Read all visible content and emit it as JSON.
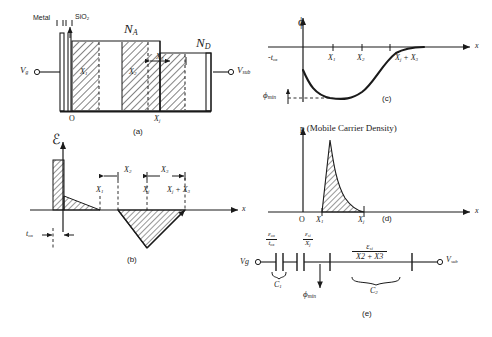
{
  "figure": {
    "ink_color": "#1a1a1a",
    "background": "#ffffff"
  },
  "panel_a": {
    "id": "(a)",
    "labels": {
      "metal": "Metal",
      "oxide": "SiO2",
      "oxide_sub": "2",
      "acceptor": "N",
      "acceptor_sub": "A",
      "donor": "N",
      "donor_sub": "D",
      "gate_terminal": "V",
      "gate_terminal_sub": "g",
      "substrate_terminal": "V",
      "substrate_terminal_sub": "sub",
      "origin": "O",
      "junction": "X",
      "junction_sub": "j",
      "band_x1": "X",
      "band_x1_sub": "1",
      "band_x2": "X",
      "band_x2_sub": "2",
      "band_x3": "X",
      "band_x3_sub": "3"
    }
  },
  "panel_b": {
    "id": "(b)",
    "labels": {
      "y_axis": "ℰ",
      "x_axis": "x",
      "t_ox": "t",
      "t_ox_sub": "ox",
      "x1": "X",
      "x1_sub": "1",
      "x2": "X",
      "x2_sub": "2",
      "x3": "X",
      "x3_sub": "3",
      "xj": "X",
      "xj_sub": "j",
      "xj_plus_x3": "X",
      "xj_plus_x3_sub": "j",
      "xj_plus_x3_tail": " + X",
      "xj_plus_x3_tail_sub": "3"
    }
  },
  "panel_c": {
    "id": "(c)",
    "labels": {
      "y_axis": "ϕ",
      "x_axis": "x",
      "neg_tox": "-t",
      "neg_tox_sub": "ox",
      "x1": "X",
      "x1_sub": "1",
      "x2": "X",
      "x2_sub": "2",
      "xj_plus_x3": "X",
      "xj_plus_x3_sub": "j",
      "xj_plus_x3_tail": " + X",
      "xj_plus_x3_tail_sub": "3",
      "phi_min": "ϕ",
      "phi_min_sub": "min"
    }
  },
  "panel_d": {
    "id": "(d)",
    "labels": {
      "y_axis": "p (Mobile Carrier Density)",
      "x_axis": "x",
      "origin": "O",
      "x1": "X",
      "x1_sub": "1",
      "xj": "X",
      "xj_sub": "j"
    }
  },
  "panel_e": {
    "id": "(e)",
    "labels": {
      "gate_terminal": "Vg",
      "substrate_terminal": "V",
      "substrate_terminal_sub": "sub",
      "c1": "C",
      "c1_sub": "1",
      "c2": "C",
      "c2_sub": "2",
      "phi_min": "ϕ",
      "phi_min_sub": "min"
    },
    "fractions": [
      {
        "name": "oxide-capacitance",
        "num": "ε",
        "num_sub": "ox",
        "den": "t",
        "den_sub": "ox"
      },
      {
        "name": "silicon-junction-capacitance",
        "num": "ε",
        "num_sub": "si",
        "den": "X",
        "den_sub": "j"
      },
      {
        "name": "depletion-capacitance",
        "num": "ε",
        "num_sub": "si",
        "den": "X2 + X3",
        "den_sub": ""
      }
    ]
  }
}
